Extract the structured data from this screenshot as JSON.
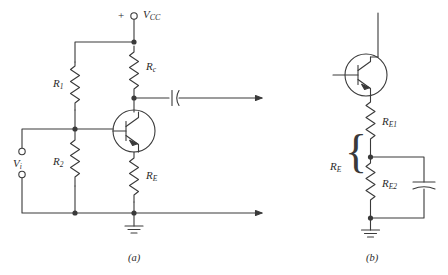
{
  "figure": {
    "stroke_color": "#3a3a3a",
    "text_color": "#2b2b2b",
    "background": "#ffffff"
  },
  "panel_a": {
    "caption": "(a)",
    "supply": {
      "polarity": "+",
      "label_main": "V",
      "label_sub": "CC",
      "terminal_icon": "open-circle-terminal"
    },
    "input": {
      "label_main": "V",
      "label_sub": "i",
      "top_terminal_icon": "open-circle-terminal",
      "bottom_terminal_icon": "open-circle-terminal"
    },
    "components": [
      {
        "name": "R1",
        "label_main": "R",
        "label_sub": "1",
        "type": "resistor"
      },
      {
        "name": "R2",
        "label_main": "R",
        "label_sub": "2",
        "type": "resistor"
      },
      {
        "name": "RC",
        "label_main": "R",
        "label_sub": "c",
        "type": "resistor"
      },
      {
        "name": "RE",
        "label_main": "R",
        "label_sub": "E",
        "type": "resistor"
      },
      {
        "name": "Q1",
        "label_main": "",
        "label_sub": "",
        "type": "npn-transistor"
      },
      {
        "name": "Cout",
        "label_main": "",
        "label_sub": "",
        "type": "capacitor"
      }
    ],
    "ground_icon": "ground-symbol",
    "output_arrow_icon": "arrow-right"
  },
  "panel_b": {
    "caption": "(b)",
    "components": [
      {
        "name": "RE1",
        "label_main": "R",
        "label_sub": "E1",
        "type": "resistor"
      },
      {
        "name": "RE2",
        "label_main": "R",
        "label_sub": "E2",
        "type": "resistor"
      },
      {
        "name": "RE_total",
        "label_main": "R",
        "label_sub": "E",
        "type": "brace-label"
      },
      {
        "name": "CE",
        "label_main": "",
        "label_sub": "",
        "type": "capacitor"
      },
      {
        "name": "Q2",
        "label_main": "",
        "label_sub": "",
        "type": "npn-transistor"
      }
    ],
    "brace_glyph": "{",
    "ground_icon": "ground-symbol"
  }
}
